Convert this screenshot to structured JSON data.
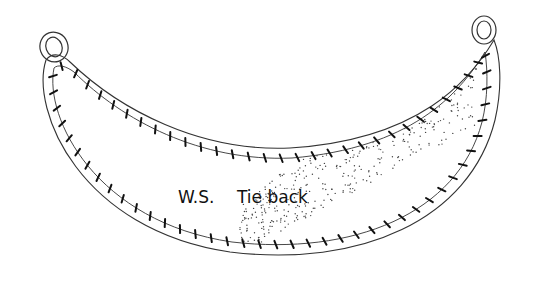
{
  "figure": {
    "label_side": "W.S.",
    "label_name": "Tie back",
    "colors": {
      "line": "#333333",
      "stitch": "#111111",
      "background": "#ffffff"
    }
  }
}
